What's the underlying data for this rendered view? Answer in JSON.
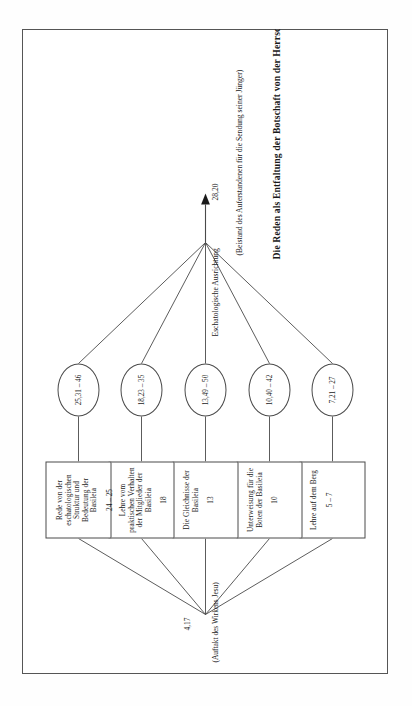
{
  "document": {
    "language": "de",
    "caption": "Die Reden als Entfaltung der Botschaft von der Herrschaft Gottes"
  },
  "diagram": {
    "type": "tree-diagram",
    "orientation": "rotated-90-ccw",
    "root": {
      "reference": "4,17",
      "note": "(Auftakt des Wirkens Jesu)"
    },
    "target": {
      "axis_label": "Eschatologische Ausrichtung",
      "reference": "28,20",
      "note": "(Beistand des Auferstandenen für die Sendung seiner Jünger)"
    },
    "nodes": [
      {
        "id": "discourse-1",
        "title": "Lehre auf dem Berg",
        "reference": "5 – 7",
        "ellipse": "7,21 – 27"
      },
      {
        "id": "discourse-2",
        "title": "Unterweisung für die Boten der Basileia",
        "reference": "10",
        "ellipse": "10,40 – 42"
      },
      {
        "id": "discourse-3",
        "title": "Die Gleichnisse der Basileia",
        "reference": "13",
        "ellipse": "13,49 – 50"
      },
      {
        "id": "discourse-4",
        "title": "Lehre vom praktischen Verhalten der Mitglieder der Basileia",
        "reference": "18",
        "ellipse": "18,23 – 35"
      },
      {
        "id": "discourse-5",
        "title": "Rede von der eschatologischen Struktur und Bedeutung der Basileia",
        "reference": "24 – 25",
        "ellipse": "25,31 – 46"
      }
    ],
    "colors": {
      "stroke": "#4a4a4a",
      "page_border": "#555555",
      "text": "#1a1a1a",
      "background": "#ffffff"
    }
  }
}
